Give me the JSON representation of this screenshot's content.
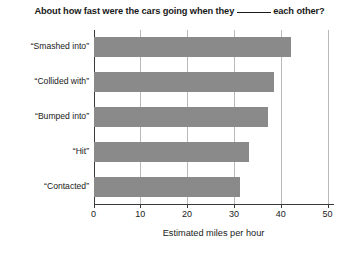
{
  "chart_data": {
    "type": "bar",
    "orientation": "horizontal",
    "title_prefix": "About how fast were the cars going when they",
    "title_blank": "______",
    "title_suffix": "each other?",
    "categories": [
      "“Smashed into”",
      "“Collided with”",
      "“Bumped into”",
      "“Hit”",
      "“Contacted”"
    ],
    "values": [
      42.1,
      38.6,
      37.3,
      33.3,
      31.2
    ],
    "xlabel": "Estimated miles per hour",
    "ylabel": "",
    "xlim": [
      0,
      50
    ],
    "xticks": [
      0,
      10,
      20,
      30,
      40,
      50
    ],
    "xtick_labels": [
      "0",
      "10",
      "20",
      "30",
      "40",
      "50"
    ],
    "grid": "vertical",
    "legend": null,
    "bar_color": "#8a8a8a",
    "grid_color": "#b9b9b9",
    "axis_color": "#3a3a3a",
    "background_color": "#ffffff"
  }
}
